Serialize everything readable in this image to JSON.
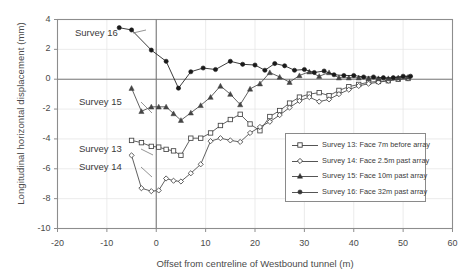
{
  "chart_data": {
    "type": "line",
    "title": "",
    "xlabel": "Offset from centreline of Westbound tunnel (m)",
    "ylabel": "Longitudinal horizontal displacement (mm)",
    "xlim": [
      -20,
      60
    ],
    "ylim": [
      -10,
      4
    ],
    "xticks": [
      -20,
      -10,
      0,
      10,
      20,
      30,
      40,
      50,
      60
    ],
    "yticks": [
      4,
      2,
      0,
      -2,
      -4,
      -6,
      -8,
      -10
    ],
    "grid": "light-horizontal-and-vertical",
    "legend_position": "inside-lower-right",
    "series": [
      {
        "name": "Survey 13: Face 7m before array",
        "marker": "open-square",
        "color": "#444444",
        "points": [
          [
            -5.0,
            -4.1
          ],
          [
            -3.0,
            -4.25
          ],
          [
            -1.0,
            -4.5
          ],
          [
            0.5,
            -4.55
          ],
          [
            2.0,
            -4.7
          ],
          [
            3.5,
            -4.8
          ],
          [
            5.0,
            -5.1
          ],
          [
            7.0,
            -3.95
          ],
          [
            9.0,
            -3.95
          ],
          [
            11.0,
            -3.6
          ],
          [
            13.0,
            -3.1
          ],
          [
            15.0,
            -2.7
          ],
          [
            17.0,
            -2.35
          ],
          [
            19.0,
            -3.0
          ],
          [
            21.0,
            -3.45
          ],
          [
            23.0,
            -2.5
          ],
          [
            25.0,
            -2.1
          ],
          [
            27.0,
            -1.6
          ],
          [
            29.0,
            -1.2
          ],
          [
            31.0,
            -1.0
          ],
          [
            33.0,
            -0.9
          ],
          [
            35.0,
            -1.1
          ],
          [
            37.0,
            -0.75
          ],
          [
            39.0,
            -0.5
          ],
          [
            41.0,
            -0.35
          ],
          [
            43.0,
            -0.2
          ],
          [
            45.0,
            -0.15
          ],
          [
            47.0,
            -0.1
          ],
          [
            49.0,
            0.0
          ],
          [
            51.0,
            0.05
          ]
        ]
      },
      {
        "name": "Survey 14: Face 2.5m past array",
        "marker": "open-diamond",
        "color": "#444444",
        "points": [
          [
            -5.0,
            -5.1
          ],
          [
            -3.0,
            -7.3
          ],
          [
            -1.0,
            -7.5
          ],
          [
            0.5,
            -7.45
          ],
          [
            2.0,
            -6.65
          ],
          [
            3.5,
            -6.8
          ],
          [
            5.0,
            -6.85
          ],
          [
            7.0,
            -6.3
          ],
          [
            9.0,
            -5.7
          ],
          [
            11.0,
            -4.15
          ],
          [
            13.0,
            -3.95
          ],
          [
            15.0,
            -4.1
          ],
          [
            17.0,
            -4.2
          ],
          [
            19.0,
            -3.6
          ],
          [
            21.0,
            -3.2
          ],
          [
            23.0,
            -2.85
          ],
          [
            25.0,
            -2.4
          ],
          [
            27.0,
            -1.9
          ],
          [
            29.0,
            -1.45
          ],
          [
            31.0,
            -1.2
          ],
          [
            33.0,
            -1.5
          ],
          [
            35.0,
            -1.35
          ],
          [
            37.0,
            -1.0
          ],
          [
            39.0,
            -0.7
          ],
          [
            41.0,
            -0.45
          ],
          [
            43.0,
            -0.3
          ],
          [
            45.0,
            -0.2
          ],
          [
            47.0,
            -0.1
          ],
          [
            49.0,
            0.0
          ],
          [
            51.0,
            0.05
          ]
        ]
      },
      {
        "name": "Survey 15: Face 10m past array",
        "marker": "filled-triangle",
        "color": "#444444",
        "points": [
          [
            -5.0,
            -0.6
          ],
          [
            -3.0,
            -2.15
          ],
          [
            -1.0,
            -1.85
          ],
          [
            0.5,
            -1.85
          ],
          [
            2.0,
            -1.85
          ],
          [
            3.5,
            -2.3
          ],
          [
            5.0,
            -2.75
          ],
          [
            7.0,
            -2.25
          ],
          [
            9.0,
            -1.75
          ],
          [
            11.0,
            -1.2
          ],
          [
            13.0,
            -0.45
          ],
          [
            15.0,
            -1.0
          ],
          [
            17.0,
            -1.7
          ],
          [
            19.0,
            -0.65
          ],
          [
            21.0,
            -0.3
          ],
          [
            23.0,
            0.45
          ],
          [
            25.0,
            0.15
          ],
          [
            27.0,
            -0.2
          ],
          [
            29.0,
            0.25
          ],
          [
            31.0,
            0.5
          ],
          [
            33.0,
            0.2
          ],
          [
            35.0,
            0.45
          ],
          [
            37.0,
            0.1
          ],
          [
            39.0,
            0.1
          ],
          [
            41.0,
            0.1
          ],
          [
            43.0,
            0.05
          ],
          [
            45.0,
            0.05
          ],
          [
            47.0,
            0.05
          ],
          [
            49.0,
            0.1
          ],
          [
            51.0,
            0.15
          ]
        ]
      },
      {
        "name": "Survey 16: Face 32m past array",
        "marker": "filled-circle",
        "color": "#1a1a1a",
        "points": [
          [
            -7.5,
            3.45
          ],
          [
            -5.0,
            3.3
          ],
          [
            -1.0,
            1.95
          ],
          [
            2.0,
            1.2
          ],
          [
            4.5,
            -0.6
          ],
          [
            7.0,
            0.5
          ],
          [
            9.5,
            0.75
          ],
          [
            12.0,
            0.65
          ],
          [
            15.0,
            1.2
          ],
          [
            17.5,
            1.0
          ],
          [
            20.0,
            0.95
          ],
          [
            22.0,
            0.6
          ],
          [
            24.0,
            1.05
          ],
          [
            26.0,
            0.9
          ],
          [
            28.0,
            0.6
          ],
          [
            30.0,
            0.65
          ],
          [
            32.0,
            0.45
          ],
          [
            34.0,
            0.55
          ],
          [
            36.0,
            0.3
          ],
          [
            38.0,
            0.25
          ],
          [
            40.0,
            0.25
          ],
          [
            42.0,
            0.15
          ],
          [
            44.0,
            0.15
          ],
          [
            46.0,
            0.1
          ],
          [
            48.0,
            0.1
          ],
          [
            50.0,
            0.2
          ],
          [
            51.5,
            0.2
          ]
        ]
      }
    ],
    "annotations": [
      {
        "text": "Survey 16",
        "x_px": 75,
        "y_px": 27
      },
      {
        "text": "Survey 15",
        "x_px": 79,
        "y_px": 96
      },
      {
        "text": "Survey 13",
        "x_px": 79,
        "y_px": 143
      },
      {
        "text": "Survey 14",
        "x_px": 79,
        "y_px": 161
      }
    ]
  },
  "axis": {
    "ytick_labels": [
      "4",
      "2",
      "0",
      "-2",
      "-4",
      "-6",
      "-8",
      "-10"
    ],
    "xtick_labels": [
      "-20",
      "-10",
      "0",
      "10",
      "20",
      "30",
      "40",
      "50",
      "60"
    ]
  },
  "legend": {
    "items": [
      {
        "label": "Survey 13: Face 7m before array",
        "marker": "open-square"
      },
      {
        "label": "Survey 14: Face 2.5m past array",
        "marker": "open-diamond"
      },
      {
        "label": "Survey 15: Face 10m past array",
        "marker": "filled-triangle"
      },
      {
        "label": "Survey 16: Face 32m past array",
        "marker": "filled-circle"
      }
    ]
  },
  "colors": {
    "axis": "#7a7a7a",
    "grid": "#e6e6e6",
    "series": "#3f3f3f",
    "text": "#4a4a4a"
  }
}
